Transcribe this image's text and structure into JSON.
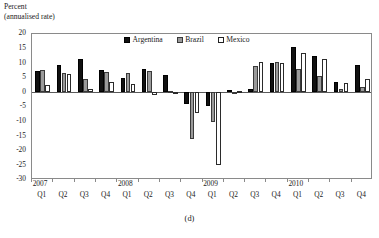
{
  "figure": {
    "caption": "(d)",
    "y_axis_title_line1": "Percent",
    "y_axis_title_line2": "(annualised rate)"
  },
  "legend": {
    "position": "top-center",
    "items": [
      {
        "label": "Argentina",
        "key": "arg",
        "color": "#111111"
      },
      {
        "label": "Brazil",
        "key": "bra",
        "color": "#9a9a9a"
      },
      {
        "label": "Mexico",
        "key": "mex",
        "color": "#ffffff"
      }
    ]
  },
  "axis": {
    "y_ticks": [
      20,
      15,
      10,
      5,
      0,
      -5,
      -10,
      -15,
      -20,
      -25,
      -30
    ],
    "y_tick_labels": [
      "20",
      "15",
      "10",
      "5",
      "0",
      "-5",
      "-10",
      "-15",
      "-20",
      "-25",
      "-30"
    ],
    "ylim": [
      -30,
      20
    ],
    "years": [
      "2007",
      "2008",
      "2009",
      "2010"
    ],
    "quarters": [
      "Q1",
      "Q2",
      "Q3",
      "Q4"
    ]
  },
  "chart_data": {
    "type": "bar",
    "title": "",
    "subtitle": "",
    "xlabel": "",
    "ylabel": "Percent (annualised rate)",
    "ylim": [
      -30,
      20
    ],
    "grid": false,
    "legend_position": "top-center",
    "categories": [
      "2007 Q1",
      "2007 Q2",
      "2007 Q3",
      "2007 Q4",
      "2008 Q1",
      "2008 Q2",
      "2008 Q3",
      "2008 Q4",
      "2009 Q1",
      "2009 Q2",
      "2009 Q3",
      "2009 Q4",
      "2010 Q1",
      "2010 Q2",
      "2010 Q3",
      "2010 Q4"
    ],
    "series": [
      {
        "name": "Argentina",
        "color": "#111111",
        "values": [
          7.2,
          9.3,
          11.5,
          7.6,
          4.8,
          8.0,
          6.0,
          -4.0,
          -4.5,
          0.8,
          1.2,
          10.0,
          15.5,
          12.5,
          3.5,
          9.5
        ]
      },
      {
        "name": "Brazil",
        "color": "#9a9a9a",
        "values": [
          7.6,
          6.6,
          4.6,
          6.9,
          6.8,
          7.2,
          0.5,
          -16.0,
          -10.0,
          0.2,
          9.0,
          10.5,
          8.0,
          5.5,
          1.3,
          2.0
        ]
      },
      {
        "name": "Mexico",
        "color": "#ffffff",
        "values": [
          2.4,
          6.3,
          1.1,
          3.6,
          2.8,
          -1.0,
          0.2,
          -7.0,
          -25.0,
          0.5,
          10.5,
          10.0,
          13.5,
          11.5,
          3.2,
          4.5
        ]
      }
    ]
  }
}
